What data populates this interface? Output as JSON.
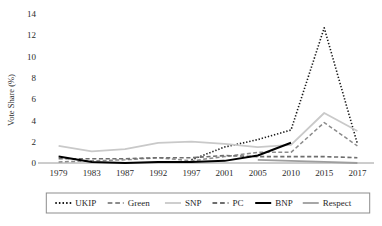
{
  "chart_data": {
    "type": "line",
    "title": "",
    "xlabel": "",
    "ylabel": "Vote Share (%)",
    "x": [
      "1979",
      "1983",
      "1987",
      "1992",
      "1997",
      "2001",
      "2005",
      "2010",
      "2015",
      "2017"
    ],
    "ylim": [
      0,
      14
    ],
    "yticks": [
      0,
      2,
      4,
      6,
      8,
      10,
      12,
      14
    ],
    "ytick_labels": [
      "0",
      "2",
      "4",
      "6",
      "8",
      "10",
      "12",
      "14"
    ],
    "grid": false,
    "legend_position": "bottom",
    "series": [
      {
        "name": "UKIP",
        "color": "#1a1a1a",
        "style": "dotted",
        "width": 1.6,
        "values": [
          null,
          null,
          null,
          null,
          0.3,
          1.5,
          2.2,
          3.1,
          12.7,
          1.8
        ]
      },
      {
        "name": "Green",
        "color": "#8c8c8c",
        "style": "dashed",
        "width": 1.5,
        "values": [
          0.1,
          0.2,
          0.3,
          0.5,
          0.2,
          0.6,
          1.0,
          1.0,
          3.8,
          1.6
        ]
      },
      {
        "name": "SNP",
        "color": "#c9c9c9",
        "style": "solid",
        "width": 1.8,
        "values": [
          1.6,
          1.1,
          1.3,
          1.9,
          2.0,
          1.8,
          1.5,
          1.7,
          4.7,
          3.0
        ]
      },
      {
        "name": "PC",
        "color": "#6e6e6e",
        "style": "dashed",
        "width": 1.6,
        "values": [
          0.4,
          0.4,
          0.4,
          0.5,
          0.5,
          0.7,
          0.6,
          0.6,
          0.6,
          0.5
        ]
      },
      {
        "name": "BNP",
        "color": "#000000",
        "style": "solid",
        "width": 2.0,
        "values": [
          0.6,
          0.1,
          0.0,
          0.1,
          0.1,
          0.2,
          0.7,
          1.9,
          null,
          null
        ]
      },
      {
        "name": "Respect",
        "color": "#9e9e9e",
        "style": "solid",
        "width": 1.8,
        "values": [
          null,
          null,
          null,
          null,
          null,
          null,
          0.3,
          0.2,
          0.1,
          0.0
        ]
      }
    ]
  },
  "axis": {
    "y_title": "Vote Share (%)"
  },
  "legend": {
    "items": [
      {
        "label": "UKIP"
      },
      {
        "label": "Green"
      },
      {
        "label": "SNP"
      },
      {
        "label": "PC"
      },
      {
        "label": "BNP"
      },
      {
        "label": "Respect"
      }
    ]
  }
}
